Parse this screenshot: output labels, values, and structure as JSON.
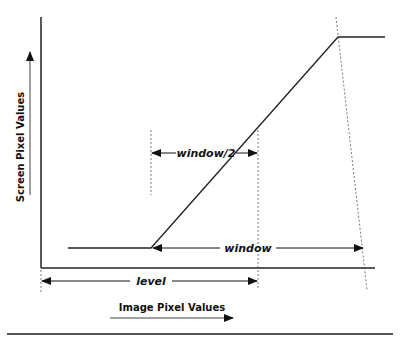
{
  "diagram": {
    "y_axis_label": "Screen Pixel Values",
    "x_axis_label": "Image Pixel Values",
    "labels": {
      "window_half": "window/2",
      "window": "window",
      "level": "level"
    },
    "colors": {
      "line": "#222222",
      "dashed": "#555555",
      "rule": "#555555"
    }
  }
}
